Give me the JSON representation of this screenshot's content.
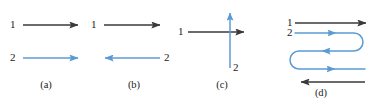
{
  "figure": {
    "width": 374,
    "height": 106,
    "background": "#ffffff",
    "colors": {
      "line1": "#3a3a3a",
      "line2": "#5b9bd5",
      "text": "#1a1a1a"
    },
    "line_labels": {
      "one": "1",
      "two": "2"
    }
  },
  "panels": [
    {
      "id": "a",
      "caption": "(a)",
      "description": "two parallel rays both pointing right",
      "lines": [
        {
          "name": "1",
          "color": "#3a3a3a",
          "direction": "right",
          "orientation": "horizontal",
          "label": "1",
          "label_side": "left"
        },
        {
          "name": "2",
          "color": "#5b9bd5",
          "direction": "right",
          "orientation": "horizontal",
          "label": "2",
          "label_side": "left"
        }
      ]
    },
    {
      "id": "b",
      "caption": "(b)",
      "description": "two antiparallel rays, top pointing right, bottom pointing left",
      "lines": [
        {
          "name": "1",
          "color": "#3a3a3a",
          "direction": "right",
          "orientation": "horizontal",
          "label": "1",
          "label_side": "left"
        },
        {
          "name": "2",
          "color": "#5b9bd5",
          "direction": "left",
          "orientation": "horizontal",
          "label": "2",
          "label_side": "right"
        }
      ]
    },
    {
      "id": "c",
      "caption": "(c)",
      "description": "horizontal ray pointing right crossed by a vertical ray pointing up",
      "lines": [
        {
          "name": "1",
          "color": "#3a3a3a",
          "direction": "right",
          "orientation": "horizontal",
          "label": "1",
          "label_side": "left"
        },
        {
          "name": "2",
          "color": "#5b9bd5",
          "direction": "up",
          "orientation": "vertical",
          "label": "2",
          "label_side": "bottom"
        }
      ]
    },
    {
      "id": "d",
      "caption": "(d)",
      "description": "straight ray pointing right on top, serpentine folded path below, straight ray pointing left at bottom",
      "lines": [
        {
          "name": "1",
          "color": "#3a3a3a",
          "direction": "right",
          "orientation": "horizontal",
          "label": "1",
          "label_side": "left"
        },
        {
          "name": "2",
          "color": "#5b9bd5",
          "direction": "serpentine-right-left-right",
          "orientation": "folded",
          "label": "2",
          "label_side": "left"
        },
        {
          "name": "3",
          "color": "#3a3a3a",
          "direction": "left",
          "orientation": "horizontal",
          "label": "",
          "label_side": "none"
        }
      ]
    }
  ],
  "captions": {
    "a": "(a)",
    "b": "(b)",
    "c": "(c)",
    "d": "(d)"
  }
}
